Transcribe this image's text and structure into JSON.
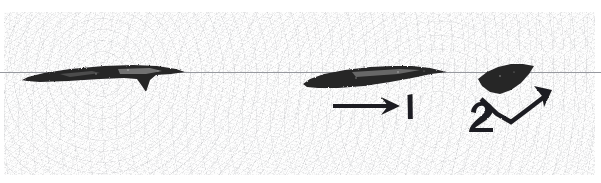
{
  "figure": {
    "kind": "scanned-halftone-figure",
    "width": 601,
    "height": 183,
    "background_color": "#fdfdfd",
    "page_margin_color": "#ffffff",
    "ink_color": "#262527",
    "grain_color": "#76787e",
    "seam_color": "#96989e",
    "top_margin_height": 12,
    "bottom_margin_height": 8,
    "left_margin_width": 4,
    "right_margin_width": 6,
    "seam_y": 72
  },
  "specimens": [
    {
      "id": "specimen-left",
      "label": "",
      "description": "long thin blade silhouette with a downward notch",
      "bbox": [
        22,
        62,
        185,
        94
      ],
      "path": "M22,80 L28,77 L44,73 L70,69 L104,66 L133,65 L157,66 L176,69 L185,72 L171,74 L156,75 L150,80 L146,92 L142,86 L137,79 L124,78 L100,79 L68,81 L40,82 L27,81 Z"
    },
    {
      "id": "specimen-middle",
      "label": "",
      "description": "tapered elongated blade silhouette pointing right",
      "bbox": [
        303,
        64,
        447,
        90
      ],
      "path": "M303,84 L310,79 L324,74 L345,70 L370,67 L392,66 L412,66 L430,68 L447,72 L431,74 L412,78 L390,82 L364,86 L338,88 L318,88 L307,87 Z"
    },
    {
      "id": "specimen-right",
      "label": "",
      "description": "dark lens-shaped rhomboid silhouette",
      "bbox": [
        476,
        64,
        534,
        95
      ],
      "path": "M478,79 L487,72 L498,67 L511,64 L523,64 L534,66 L529,74 L521,83 L511,90 L500,94 L490,92 L482,86 Z"
    }
  ],
  "annotations": [
    {
      "id": "arrow-1",
      "label": "1",
      "type": "straight-arrow",
      "direction": "right",
      "shaft": {
        "x1": 333,
        "y1": 106,
        "x2": 396,
        "y2": 106
      },
      "head": "M381,97 L400,106 L381,115 L388,106 Z",
      "label_position": {
        "x": 406,
        "y": 118
      },
      "label_glyph_path": "M407,95 L411,94 L411,118 L407,118 Z"
    },
    {
      "id": "arrow-2",
      "label": "2",
      "type": "bent-arrow",
      "direction": "up-right",
      "polyline": "481,99 497,114 511,122 527,110 544,97",
      "head": "M534,86 L552,90 L544,107 L542,96 Z",
      "label_position": {
        "x": 472,
        "y": 130
      }
    }
  ],
  "text_items": [
    {
      "id": "callout-number-1",
      "value": "1"
    },
    {
      "id": "callout-number-2",
      "value": "2"
    }
  ]
}
